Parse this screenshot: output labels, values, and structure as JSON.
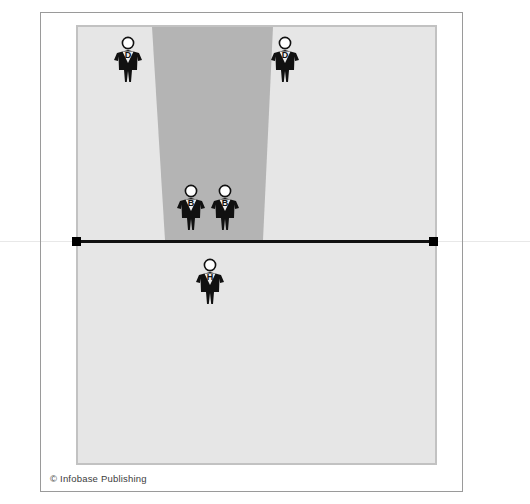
{
  "figure": {
    "credit": "© Infobase Publishing"
  },
  "court": {
    "background_color": "#e6e6e6",
    "border_color": "#c2c2c2",
    "lane_color": "#b4b4b4",
    "net_line_color": "#111111",
    "frame_color": "#9a9a9a"
  },
  "players": [
    {
      "label": "D",
      "role": "defender",
      "x": 113,
      "y": 36,
      "side": "top-left"
    },
    {
      "label": "D",
      "role": "defender",
      "x": 270,
      "y": 36,
      "side": "top-right"
    },
    {
      "label": "B",
      "role": "blocker",
      "x": 176,
      "y": 184,
      "side": "front-left"
    },
    {
      "label": "B",
      "role": "blocker",
      "x": 210,
      "y": 184,
      "side": "front-right"
    },
    {
      "label": "H",
      "role": "hitter",
      "x": 195,
      "y": 258,
      "side": "back-center"
    }
  ],
  "lane": {
    "name": "attack-lane",
    "top_left_x": 152,
    "top_right_x": 273,
    "bottom_left_x": 165,
    "bottom_right_x": 263,
    "top_y": 26,
    "bottom_y": 240
  }
}
